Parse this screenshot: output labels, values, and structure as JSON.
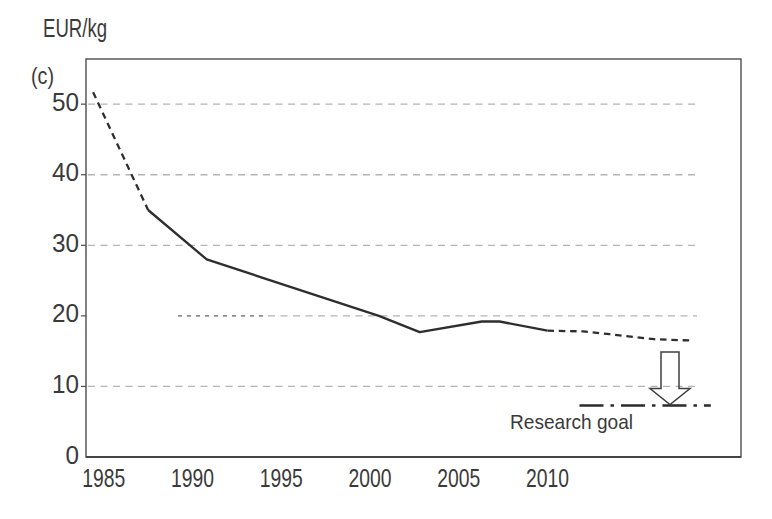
{
  "figure": {
    "unit_label": "EUR/kg",
    "panel_label": "(c)",
    "annotation_label": "Research goal"
  },
  "chart_data": {
    "type": "line",
    "title": "",
    "ylabel": "EUR/kg",
    "panel": "(c)",
    "xlabel": "",
    "x_ticks": [
      1985,
      1990,
      1995,
      2000,
      2005,
      2010
    ],
    "y_ticks": [
      0,
      10,
      20,
      30,
      40,
      50
    ],
    "x_range": [
      1984,
      2020.9
    ],
    "y_range": [
      0,
      56.4
    ],
    "grid": {
      "orientation": "horizontal",
      "style": "dashed",
      "values": [
        10,
        20,
        30,
        40,
        50
      ]
    },
    "legend": "none",
    "series": [
      {
        "name": "price-per-kg",
        "segments": [
          {
            "style": "dashed",
            "points": [
              [
                1984.4,
                51.7
              ],
              [
                1987.5,
                35
              ]
            ]
          },
          {
            "style": "solid",
            "points": [
              [
                1987.5,
                35
              ],
              [
                1990.8,
                28
              ],
              [
                2000.5,
                20
              ],
              [
                2002.8,
                17.7
              ],
              [
                2006.3,
                19.2
              ],
              [
                2007.3,
                19.2
              ],
              [
                2010,
                17.9
              ]
            ]
          },
          {
            "style": "dashed",
            "points": [
              [
                2010,
                17.9
              ],
              [
                2012,
                17.8
              ],
              [
                2013.5,
                17.4
              ],
              [
                2016,
                16.7
              ],
              [
                2018.2,
                16.5
              ]
            ]
          }
        ]
      }
    ],
    "research_goal": {
      "label": "Research goal",
      "style": "dash-dot",
      "value": 7.3,
      "x_start": 2011.8,
      "x_end": 2019.2
    },
    "arrow": {
      "direction": "down",
      "x": 2016.9,
      "from_value": 14.9,
      "to_value": 7.3
    },
    "colors": {
      "line": "#2e2e2e",
      "grid": "#b4b4b4",
      "grid_dark": "#8f8f8f",
      "axis": "#4d4d4d",
      "text": "#3a3a3a",
      "goal_line": "#2b2b2b",
      "background": "#ffffff"
    }
  }
}
